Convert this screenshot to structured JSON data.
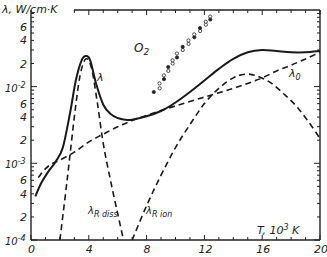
{
  "chart_data": {
    "type": "line",
    "title": "",
    "xlabel": "T, 10^3 K",
    "ylabel": "λ, W/cm·K",
    "xlim": [
      0,
      20
    ],
    "ylim": [
      0.0001,
      0.1
    ],
    "yscale": "log",
    "grid": false,
    "x_ticks": [
      0,
      4,
      8,
      12,
      16,
      20
    ],
    "x_tick_labels": [
      "0",
      "4",
      "8",
      "12",
      "16",
      "20"
    ],
    "y_tick_labels": [
      {
        "value": 0.06,
        "label": "6"
      },
      {
        "value": 0.04,
        "label": "4"
      },
      {
        "value": 0.02,
        "label": "2"
      },
      {
        "value": 0.01,
        "label": "10^-2"
      },
      {
        "value": 0.006,
        "label": "6"
      },
      {
        "value": 0.004,
        "label": "4"
      },
      {
        "value": 0.002,
        "label": "2"
      },
      {
        "value": 0.001,
        "label": "10^-3"
      },
      {
        "value": 0.0006,
        "label": "6"
      },
      {
        "value": 0.0004,
        "label": "4"
      },
      {
        "value": 0.0002,
        "label": "2"
      },
      {
        "value": 0.0001,
        "label": "10^-4"
      }
    ],
    "annotations": [
      {
        "text": "O2",
        "x": 9.2,
        "y": 0.033
      },
      {
        "text": "λ",
        "x": 4.6,
        "y": 0.011
      },
      {
        "text": "λ0",
        "x": 17.3,
        "y": 0.0135
      },
      {
        "text": "λR diss",
        "x": 4.1,
        "y": 0.00021
      },
      {
        "text": "λR ion",
        "x": 7.4,
        "y": 0.00021
      }
    ],
    "series": [
      {
        "name": "λ",
        "style": "solid",
        "x": [
          0.3,
          0.7,
          1.2,
          1.7,
          2.2,
          2.7,
          3.1,
          3.5,
          3.8,
          4.1,
          4.5,
          5.0,
          5.5,
          6.0,
          6.5,
          7.0,
          8.0,
          9.0,
          10.0,
          11.0,
          12.0,
          13.0,
          14.0,
          15.0,
          16.0,
          17.0,
          18.0,
          19.0,
          20.0
        ],
        "y": [
          0.00037,
          0.00055,
          0.00078,
          0.00105,
          0.0016,
          0.0045,
          0.012,
          0.022,
          0.025,
          0.022,
          0.011,
          0.0058,
          0.0044,
          0.0039,
          0.0037,
          0.0037,
          0.0041,
          0.0048,
          0.0062,
          0.0085,
          0.012,
          0.017,
          0.023,
          0.028,
          0.03,
          0.029,
          0.028,
          0.028,
          0.029
        ]
      },
      {
        "name": "λR diss",
        "style": "dashed",
        "x": [
          2.0,
          2.5,
          3.0,
          3.4,
          3.8,
          4.2,
          4.6,
          5.0,
          5.5,
          6.0,
          6.4
        ],
        "y": [
          0.0001,
          0.0006,
          0.004,
          0.014,
          0.023,
          0.017,
          0.006,
          0.0018,
          0.0006,
          0.00022,
          0.0001
        ]
      },
      {
        "name": "λR ion",
        "style": "dashed",
        "x": [
          7.0,
          8.0,
          9.0,
          10.0,
          11.0,
          12.0,
          13.0,
          14.0,
          14.8,
          15.5,
          16.5,
          17.5,
          18.5,
          19.5,
          20.0
        ],
        "y": [
          0.0001,
          0.00028,
          0.0007,
          0.0016,
          0.0032,
          0.006,
          0.0095,
          0.013,
          0.0145,
          0.014,
          0.0115,
          0.008,
          0.0052,
          0.0029,
          0.0021
        ]
      },
      {
        "name": "λ0",
        "style": "dashed",
        "x": [
          0.5,
          1.0,
          1.5,
          2.0,
          3.0,
          4.0,
          5.0,
          6.0,
          7.0,
          8.0,
          9.0,
          10.0,
          11.0,
          12.0,
          13.0,
          14.0,
          15.0,
          16.0,
          17.0,
          18.0,
          19.0,
          20.0
        ],
        "y": [
          0.00065,
          0.00085,
          0.001,
          0.0011,
          0.0014,
          0.0019,
          0.0024,
          0.003,
          0.0036,
          0.0042,
          0.0049,
          0.0056,
          0.0064,
          0.0073,
          0.0083,
          0.0095,
          0.011,
          0.013,
          0.016,
          0.019,
          0.023,
          0.028
        ]
      },
      {
        "name": "O2 (experimental)",
        "style": "markers",
        "x": [
          8.6,
          8.8,
          9.0,
          9.1,
          9.3,
          9.4,
          9.6,
          9.7,
          9.9,
          10.0,
          10.2,
          10.4,
          10.6,
          10.8,
          11.0,
          11.2,
          11.4,
          11.6,
          11.8,
          12.0,
          12.2,
          12.3,
          12.5
        ],
        "y": [
          0.0085,
          0.0095,
          0.011,
          0.0125,
          0.014,
          0.016,
          0.018,
          0.02,
          0.022,
          0.024,
          0.027,
          0.03,
          0.033,
          0.036,
          0.04,
          0.044,
          0.048,
          0.053,
          0.058,
          0.064,
          0.07,
          0.075,
          0.082
        ]
      }
    ]
  },
  "labels": {
    "y_axis": "λ, W/cm·K",
    "x_axis": "T, 10",
    "x_axis_exp": "3",
    "x_axis_unit": " K",
    "o2": "O",
    "o2_sub": "2",
    "lambda": "λ",
    "lambda0": "λ",
    "lambda0_sub": "0",
    "lr_diss": "λ",
    "lr_diss_sub": "R diss",
    "lr_ion": "λ",
    "lr_ion_sub": "R ion"
  }
}
